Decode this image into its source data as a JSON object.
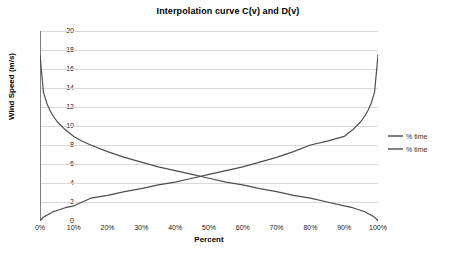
{
  "chart_data": {
    "type": "line",
    "title": "Interpolation curve C(v) and D(v)",
    "xlabel": "Percent",
    "ylabel": "Wind Speed (m/s)",
    "xlim": [
      0,
      100
    ],
    "ylim": [
      0,
      20
    ],
    "grid": true,
    "grid_axis": "y",
    "legend_position": "right",
    "x_tick_labels": [
      "0%",
      "10%",
      "20%",
      "30%",
      "40%",
      "50%",
      "60%",
      "70%",
      "80%",
      "90%",
      "100%"
    ],
    "x_tick_values": [
      0,
      10,
      20,
      30,
      40,
      50,
      60,
      70,
      80,
      90,
      100
    ],
    "y_tick_labels": [
      "0",
      "2",
      "4",
      "6",
      "8",
      "10",
      "12",
      "14",
      "16",
      "18",
      "20"
    ],
    "y_tick_values": [
      0,
      2,
      4,
      6,
      8,
      10,
      12,
      14,
      16,
      18,
      20
    ],
    "x": [
      0,
      1,
      2,
      3,
      4,
      5,
      7.5,
      10,
      12.5,
      15,
      20,
      25,
      30,
      35,
      40,
      45,
      50,
      55,
      60,
      65,
      70,
      75,
      80,
      85,
      90,
      92.5,
      95,
      96,
      97,
      98,
      99,
      100
    ],
    "series": [
      {
        "name": "% time",
        "role": "decreasing",
        "color": "#4d4d4d",
        "values": [
          17.5,
          13.6,
          12.4,
          11.6,
          11.0,
          10.5,
          9.6,
          8.9,
          8.4,
          8.0,
          7.3,
          6.7,
          6.2,
          5.7,
          5.3,
          4.9,
          4.5,
          4.1,
          3.8,
          3.4,
          3.1,
          2.7,
          2.4,
          2.0,
          1.6,
          1.4,
          1.1,
          1.0,
          0.8,
          0.6,
          0.4,
          0.0
        ]
      },
      {
        "name": "% time",
        "role": "increasing",
        "color": "#4d4d4d",
        "values": [
          0.0,
          0.4,
          0.6,
          0.8,
          1.0,
          1.1,
          1.4,
          1.6,
          2.0,
          2.4,
          2.7,
          3.1,
          3.4,
          3.8,
          4.1,
          4.5,
          4.9,
          5.3,
          5.7,
          6.2,
          6.7,
          7.3,
          8.0,
          8.4,
          8.9,
          9.6,
          10.5,
          11.0,
          11.6,
          12.4,
          13.6,
          17.5
        ]
      }
    ],
    "annotations": {
      "crossing_percent": 51,
      "crossing_wind_speed": 4.5
    },
    "colors": {
      "gridline": "#d9d9d9",
      "axis": "#808080",
      "curve": "#4d4d4d",
      "text": "#000000",
      "background": "#ffffff"
    }
  },
  "legend": {
    "entries": [
      {
        "label": "% time"
      },
      {
        "label": "% time"
      }
    ]
  }
}
